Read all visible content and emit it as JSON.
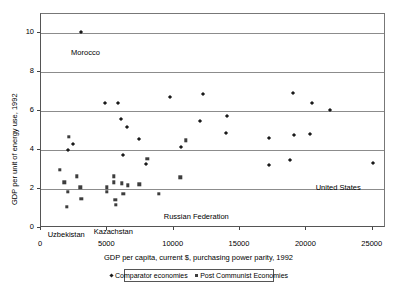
{
  "chart_data": {
    "type": "scatter",
    "title": "",
    "xlabel": "GDP per capita, current $, purchasing power parity, 1992",
    "ylabel": "GDP per unit of energy use, 1992",
    "xlim": [
      0,
      26000
    ],
    "ylim": [
      0,
      11
    ],
    "xticks": [
      0,
      5000,
      10000,
      15000,
      20000,
      25000
    ],
    "xtick_labels": [
      "0",
      "5000",
      "10000",
      "15000",
      "20000",
      "25000"
    ],
    "yticks": [
      0,
      2,
      4,
      6,
      8,
      10
    ],
    "ytick_labels": [
      "0",
      "2",
      "4",
      "6",
      "8",
      "10"
    ],
    "grid": "horizontal",
    "legend_position": "bottom",
    "series": [
      {
        "name": "Comparator economies",
        "marker": "diamond",
        "color": "#1a1a1a",
        "points": [
          [
            3000,
            10.1
          ],
          [
            4800,
            6.45
          ],
          [
            5800,
            6.45
          ],
          [
            6050,
            5.6
          ],
          [
            6450,
            5.2
          ],
          [
            7400,
            4.6
          ],
          [
            6200,
            3.75
          ],
          [
            7900,
            3.3
          ],
          [
            9700,
            6.75
          ],
          [
            10550,
            4.15
          ],
          [
            12200,
            6.9
          ],
          [
            11950,
            5.5
          ],
          [
            14000,
            5.75
          ],
          [
            13950,
            4.9
          ],
          [
            17200,
            4.65
          ],
          [
            17200,
            3.25
          ],
          [
            18800,
            3.5
          ],
          [
            19000,
            6.95
          ],
          [
            19100,
            4.8
          ],
          [
            20300,
            4.85
          ],
          [
            20450,
            6.45
          ],
          [
            21800,
            6.05
          ],
          [
            25000,
            3.35
          ],
          [
            2050,
            4.0
          ],
          [
            2400,
            4.3
          ]
        ]
      },
      {
        "name": "Post Communist Economies",
        "marker": "square",
        "color": "#3d3d3d",
        "points": [
          [
            1400,
            3.0
          ],
          [
            1750,
            2.35
          ],
          [
            2000,
            1.87
          ],
          [
            1950,
            1.1
          ],
          [
            2100,
            4.7
          ],
          [
            2700,
            2.65
          ],
          [
            2950,
            2.1
          ],
          [
            3050,
            1.5
          ],
          [
            4950,
            2.1
          ],
          [
            4950,
            1.87
          ],
          [
            5500,
            2.65
          ],
          [
            5500,
            2.35
          ],
          [
            5600,
            1.45
          ],
          [
            5650,
            1.18
          ],
          [
            6100,
            2.3
          ],
          [
            6200,
            1.75
          ],
          [
            6550,
            2.2
          ],
          [
            7400,
            2.25
          ],
          [
            8000,
            3.55
          ],
          [
            8900,
            1.75
          ],
          [
            10500,
            2.6
          ],
          [
            10900,
            4.5
          ]
        ]
      }
    ],
    "annotations": [
      {
        "text": "Morocco",
        "x": 3350,
        "y": 9.0
      },
      {
        "text": "United States",
        "x": 22400,
        "y": 2.05
      },
      {
        "text": "Russian Federation",
        "x": 11700,
        "y": 0.55
      },
      {
        "text": "Uzbekistan",
        "x": 1900,
        "y": -0.35
      },
      {
        "text": "Kazachstan",
        "x": 5450,
        "y": -0.2
      }
    ]
  },
  "legend": {
    "items": [
      {
        "label": "Comparator economies",
        "marker": "diamond"
      },
      {
        "label": "Post Communist Economies",
        "marker": "square"
      }
    ]
  }
}
